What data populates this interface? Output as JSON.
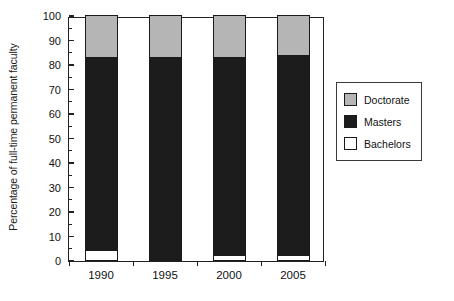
{
  "chart_data": {
    "type": "bar",
    "subtype": "stacked-100",
    "title": "",
    "xlabel": "",
    "ylabel": "Percentage of full-time permanent faculty",
    "categories": [
      "1990",
      "1995",
      "2000",
      "2005"
    ],
    "ylim": [
      0,
      100
    ],
    "yticks": [
      0,
      10,
      20,
      30,
      40,
      50,
      60,
      70,
      80,
      90,
      100
    ],
    "ytick_labels": [
      "0",
      "10",
      "20",
      "30",
      "40",
      "50",
      "60",
      "70",
      "80",
      "90",
      "100"
    ],
    "grid": false,
    "legend_position": "right",
    "series": [
      {
        "name": "Bachelors",
        "color": "#ffffff",
        "values": [
          4,
          0.5,
          2,
          2
        ]
      },
      {
        "name": "Masters",
        "color": "#1c1c1c",
        "values": [
          79,
          82.5,
          81,
          81.5
        ]
      },
      {
        "name": "Doctorate",
        "color": "#b5b5b5",
        "values": [
          17,
          17,
          17,
          16.5
        ]
      }
    ],
    "stack_order_bottom_to_top": [
      "Bachelors",
      "Masters",
      "Doctorate"
    ]
  },
  "legend": {
    "items": [
      {
        "label": "Doctorate",
        "color": "#b5b5b5"
      },
      {
        "label": "Masters",
        "color": "#1c1c1c"
      },
      {
        "label": "Bachelors",
        "color": "#ffffff"
      }
    ]
  }
}
